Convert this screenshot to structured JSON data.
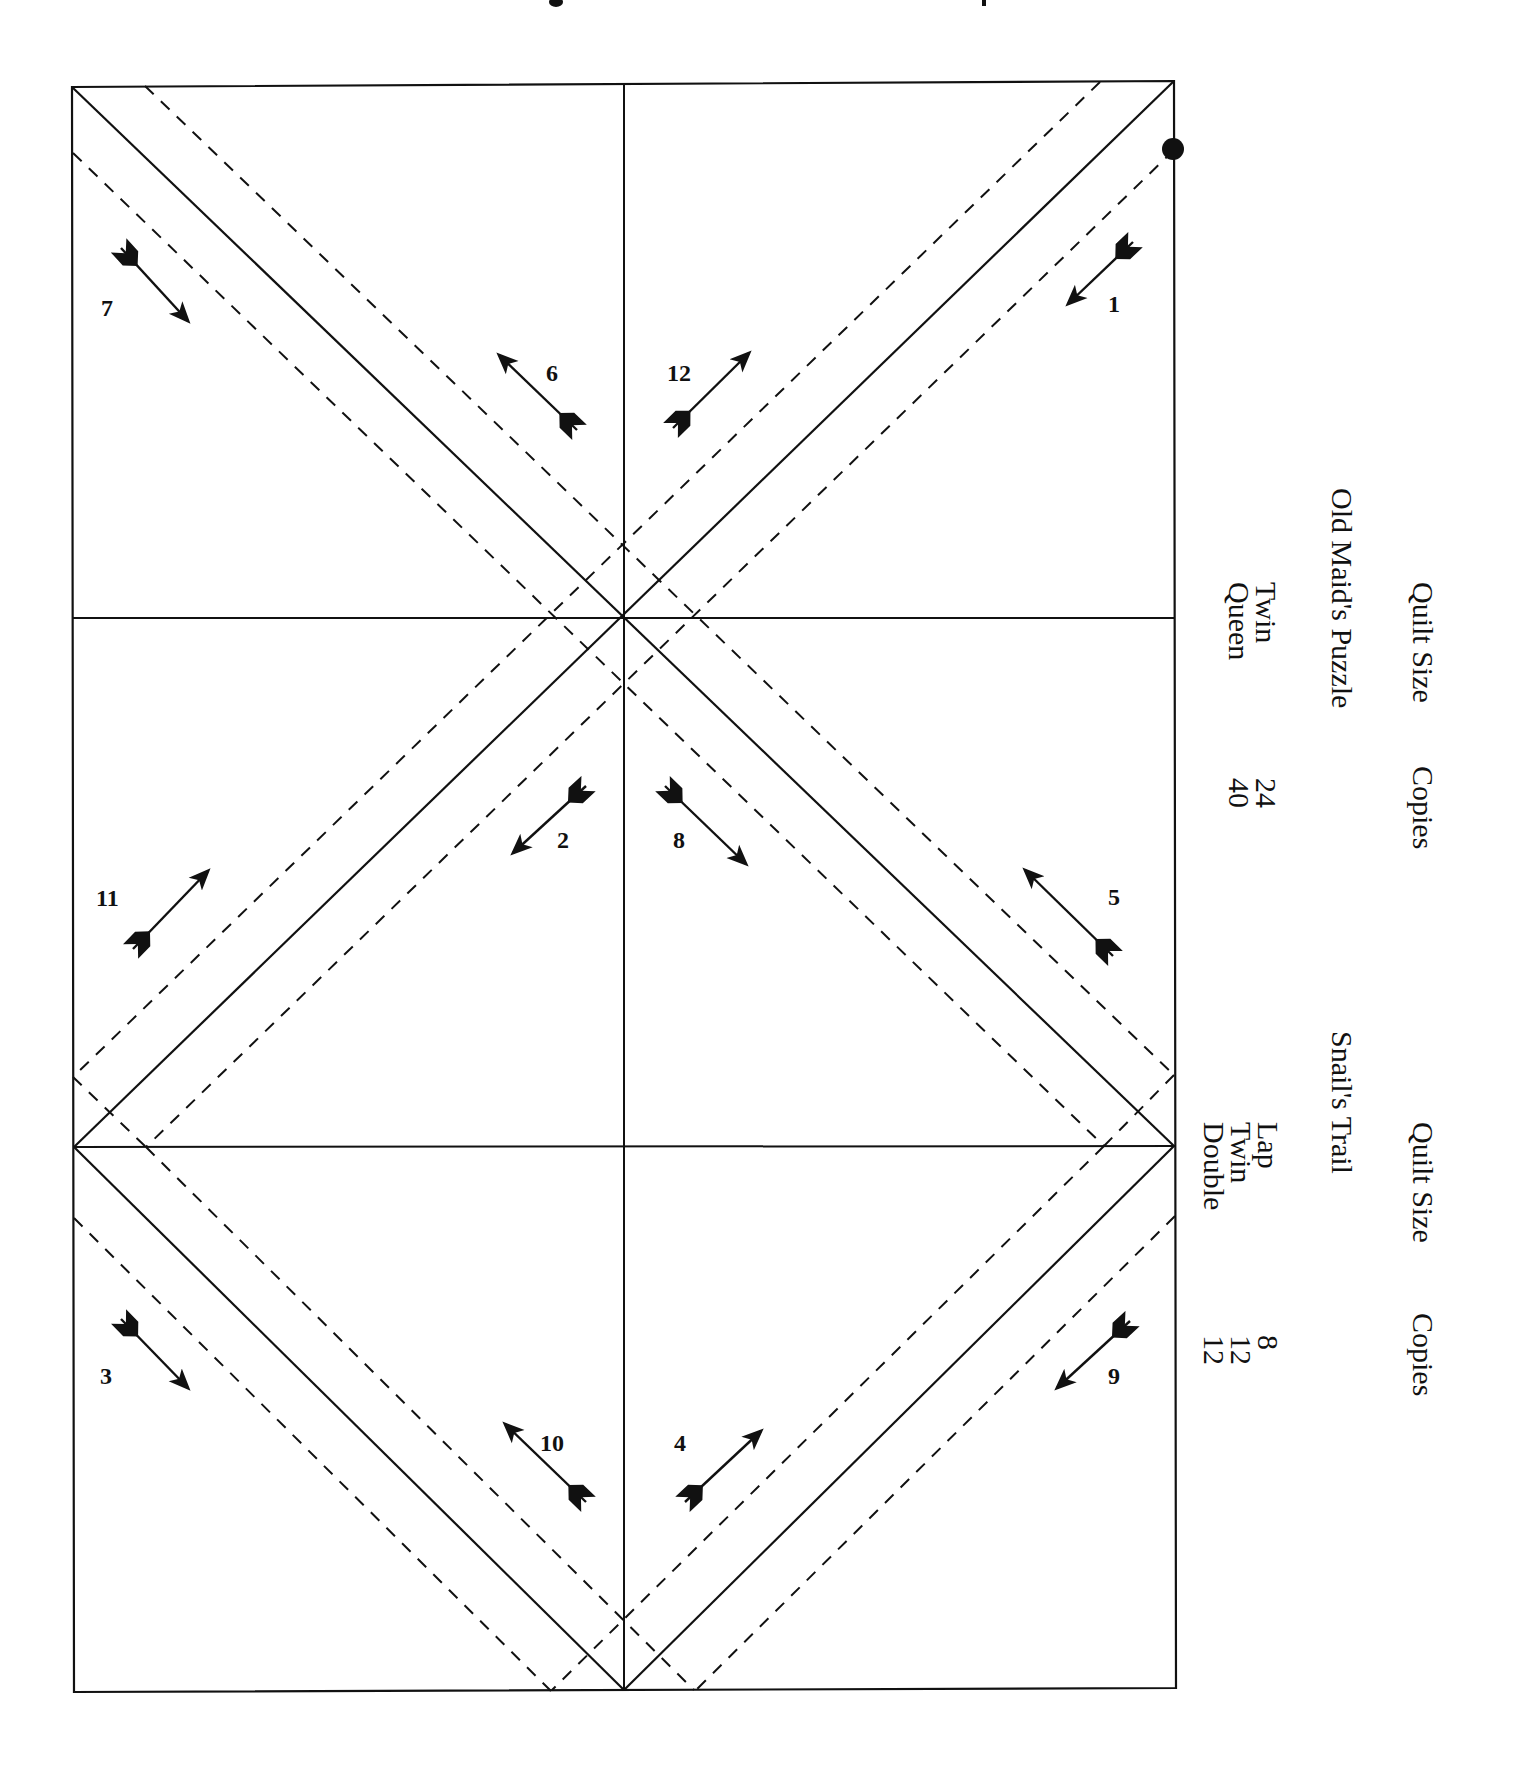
{
  "title_fragment": "",
  "colors": {
    "line": "#111111",
    "background": "#ffffff"
  },
  "diagram": {
    "pieces": [
      {
        "label": "1"
      },
      {
        "label": "2"
      },
      {
        "label": "3"
      },
      {
        "label": "4"
      },
      {
        "label": "5"
      },
      {
        "label": "6"
      },
      {
        "label": "7"
      },
      {
        "label": "8"
      },
      {
        "label": "9"
      },
      {
        "label": "10"
      },
      {
        "label": "11"
      },
      {
        "label": "12"
      }
    ]
  },
  "table_top": {
    "header_size": "Quilt Size",
    "header_copies": "Copies",
    "pattern": "Old Maid's Puzzle",
    "sizes": "Twin\nQueen",
    "copies": "24\n40"
  },
  "table_bottom": {
    "header_size": "Quilt Size",
    "header_copies": "Copies",
    "pattern": "Snail's Trail",
    "sizes": "Lap\nTwin\nDouble",
    "copies": "8\n12\n12"
  }
}
